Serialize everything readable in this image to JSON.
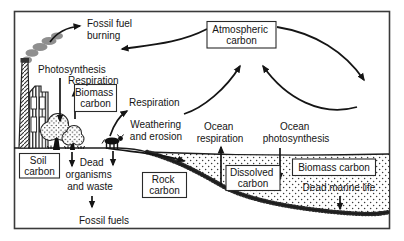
{
  "figure": {
    "type": "carbon-cycle-diagram",
    "style": "black-and-white line art, scanned textbook figure"
  },
  "boxes": {
    "atmospheric_carbon": {
      "line1": "Atmospheric",
      "line2": "carbon"
    },
    "biomass_carbon_land": {
      "line1": "Biomass",
      "line2": "carbon"
    },
    "soil_carbon": {
      "line1": "Soil",
      "line2": "carbon"
    },
    "rock_carbon": {
      "line1": "Rock",
      "line2": "carbon"
    },
    "dissolved_carbon": {
      "line1": "Dissolved",
      "line2": "carbon"
    },
    "biomass_carbon_ocean": {
      "label": "Biomass carbon"
    }
  },
  "labels": {
    "fossil_fuel_burning": {
      "line1": "Fossil fuel",
      "line2": "burning"
    },
    "photosynthesis": "Photosynthesis",
    "respiration_trees": "Respiration",
    "respiration_animals": "Respiration",
    "weathering_erosion": {
      "line1": "Weathering",
      "line2": "and erosion"
    },
    "ocean_respiration": {
      "line1": "Ocean",
      "line2": "respiration"
    },
    "ocean_photosynthesis": {
      "line1": "Ocean",
      "line2": "photosynthesis"
    },
    "dead_organisms": {
      "line1": "Dead",
      "line2": "organisms",
      "line3": "and waste"
    },
    "fossil_fuels": "Fossil fuels",
    "dead_marine_life": "Dead marine life"
  },
  "scene": {
    "factory": "factory-with-smokestack-icon",
    "smoke": "smoke-plume-icon",
    "trees": "deciduous-trees-icon",
    "cow": "grazing-cow-icon",
    "ocean": "stippled-ocean-water",
    "seabed": "sediment-seabed"
  },
  "colors": {
    "ink": "#151515",
    "smoke_gray": "#8f8f8f",
    "frame": "#3a3a3a",
    "background": "#ffffff",
    "box_fill": "#ffffff"
  }
}
